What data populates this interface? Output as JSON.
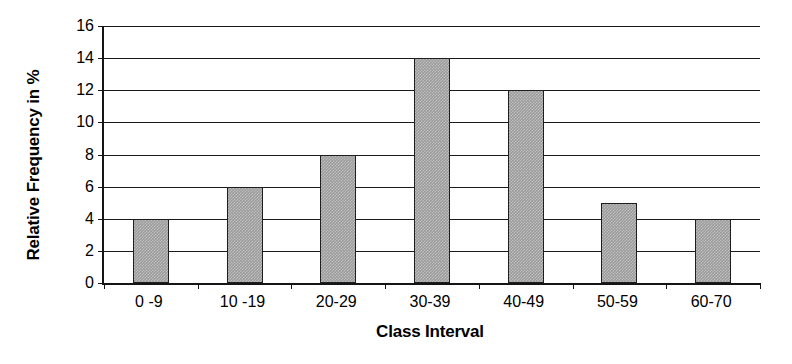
{
  "chart_data": {
    "type": "bar",
    "title": "",
    "subtitle": "",
    "xlabel": "Class Interval",
    "ylabel": "Relative Frequency in %",
    "categories": [
      "0 -9",
      "10 -19",
      "20-29",
      "30-39",
      "40-49",
      "50-59",
      "60-70"
    ],
    "values": [
      4,
      6,
      8,
      14,
      12,
      5,
      4
    ],
    "series": [
      {
        "name": "Relative Frequency",
        "values": [
          4,
          6,
          8,
          14,
          12,
          5,
          4
        ]
      }
    ],
    "ylim": [
      0,
      16
    ],
    "y_ticks": [
      0,
      2,
      4,
      6,
      8,
      10,
      12,
      14,
      16
    ],
    "y_tick_labels": [
      "0",
      "2",
      "4",
      "6",
      "8",
      "10",
      "12",
      "14",
      "16"
    ],
    "grid": true,
    "grid_axis": "y",
    "legend": false,
    "legend_position": "none",
    "bar_fill_color": "#9d9d9d",
    "bar_border_color": "#1e1e1e",
    "axis_color": "#151515",
    "grid_color": "#1a1a1a",
    "background_color": "#ffffff",
    "annotations": []
  }
}
